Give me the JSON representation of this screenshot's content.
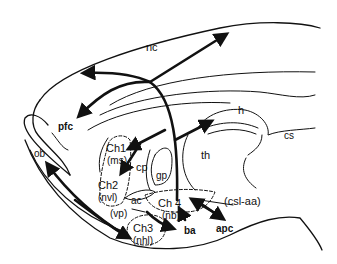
{
  "diagram": {
    "stroke_color": "#111111",
    "background": "#ffffff",
    "labels": {
      "nc": "nc",
      "h": "h",
      "cs": "cs",
      "pfc": "pfc",
      "ob": "ob",
      "th": "th",
      "cp": "cp",
      "gp": "gp",
      "ac": "ac",
      "vp": "(vp)",
      "ch1": "Ch1",
      "ms": "(ms)",
      "ch2": "Ch2",
      "nvl": "(nvl)",
      "ch3": "Ch3",
      "nhl": "(nhl)",
      "ch4": "Ch 4",
      "nb": "(nb)",
      "csl_aa": "(csl-aa)",
      "ba": "ba",
      "apc": "apc"
    }
  }
}
